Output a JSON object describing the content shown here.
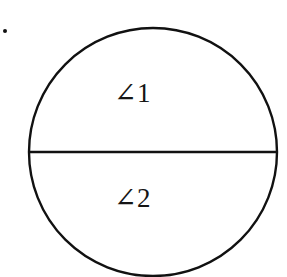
{
  "figure": {
    "kind": "geometry-diagram",
    "background_color": "#ffffff",
    "stroke_color": "#111111",
    "bullet_marker": {
      "shape": "dot",
      "x": 5,
      "y": 31,
      "radius": 2
    },
    "circle": {
      "center_x": 153,
      "center_y": 152,
      "radius": 124,
      "stroke_width": 2.4,
      "fill": "none"
    },
    "diameter_line": {
      "x1": 29,
      "y1": 152,
      "x2": 277,
      "y2": 152,
      "stroke_width": 2.4,
      "orientation": "horizontal"
    },
    "labels": [
      {
        "id": "angle-1",
        "text": "∠1",
        "region": "upper-semicircle",
        "x": 114,
        "y": 80
      },
      {
        "id": "angle-2",
        "text": "∠2",
        "region": "lower-semicircle",
        "x": 114,
        "y": 185
      }
    ]
  },
  "chart_data": {
    "type": "diagram",
    "title": "",
    "shapes": [
      {
        "name": "circle",
        "type": "circle",
        "cx": 153,
        "cy": 152,
        "r": 124
      },
      {
        "name": "diameter",
        "type": "line",
        "x1": 29,
        "y1": 152,
        "x2": 277,
        "y2": 152
      }
    ],
    "annotations": [
      "∠1",
      "∠2"
    ]
  }
}
